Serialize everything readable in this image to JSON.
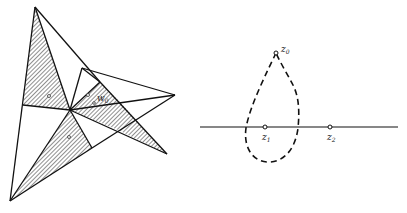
{
  "figure_left": {
    "title": "Triangulated polygon with hatched regions",
    "labels": {
      "w0": "w",
      "w0_sub": "0"
    },
    "colors": {
      "stroke": "#111111",
      "hatch": "#333333",
      "background": "#ffffff"
    }
  },
  "figure_right": {
    "title": "Loop around point on real axis",
    "labels": {
      "z0": "z",
      "z0_sub": "0",
      "z1": "z",
      "z1_sub": "1",
      "z2": "z",
      "z2_sub": "2"
    },
    "colors": {
      "stroke": "#111111"
    }
  }
}
